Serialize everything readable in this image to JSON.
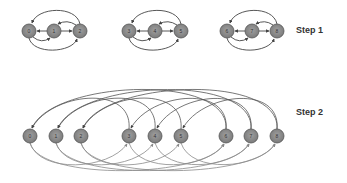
{
  "labels": {
    "step1": "Step 1",
    "step2": "Step 2"
  },
  "colors": {
    "node_fill": "#8c8c8c",
    "node_stroke": "#555555",
    "edge": "#555555",
    "edge_light": "#888888",
    "text": "#333333"
  },
  "step1": {
    "groups": [
      {
        "nodes": [
          {
            "id": "0",
            "x": 29,
            "y": 31
          },
          {
            "id": "1",
            "x": 54,
            "y": 31
          },
          {
            "id": "2",
            "x": 80,
            "y": 31
          }
        ]
      },
      {
        "nodes": [
          {
            "id": "3",
            "x": 129,
            "y": 31
          },
          {
            "id": "4",
            "x": 155,
            "y": 31
          },
          {
            "id": "5",
            "x": 181,
            "y": 31
          }
        ]
      },
      {
        "nodes": [
          {
            "id": "6",
            "x": 227,
            "y": 31
          },
          {
            "id": "7",
            "x": 252,
            "y": 31
          },
          {
            "id": "8",
            "x": 277,
            "y": 31
          }
        ]
      }
    ]
  },
  "step2": {
    "nodes": [
      {
        "id": "0",
        "x": 30,
        "y": 136
      },
      {
        "id": "1",
        "x": 56,
        "y": 136
      },
      {
        "id": "2",
        "x": 81,
        "y": 136
      },
      {
        "id": "3",
        "x": 129,
        "y": 136
      },
      {
        "id": "4",
        "x": 155,
        "y": 136
      },
      {
        "id": "5",
        "x": 181,
        "y": 136
      },
      {
        "id": "6",
        "x": 226,
        "y": 136
      },
      {
        "id": "7",
        "x": 251,
        "y": 136
      },
      {
        "id": "8",
        "x": 277,
        "y": 136
      }
    ]
  }
}
